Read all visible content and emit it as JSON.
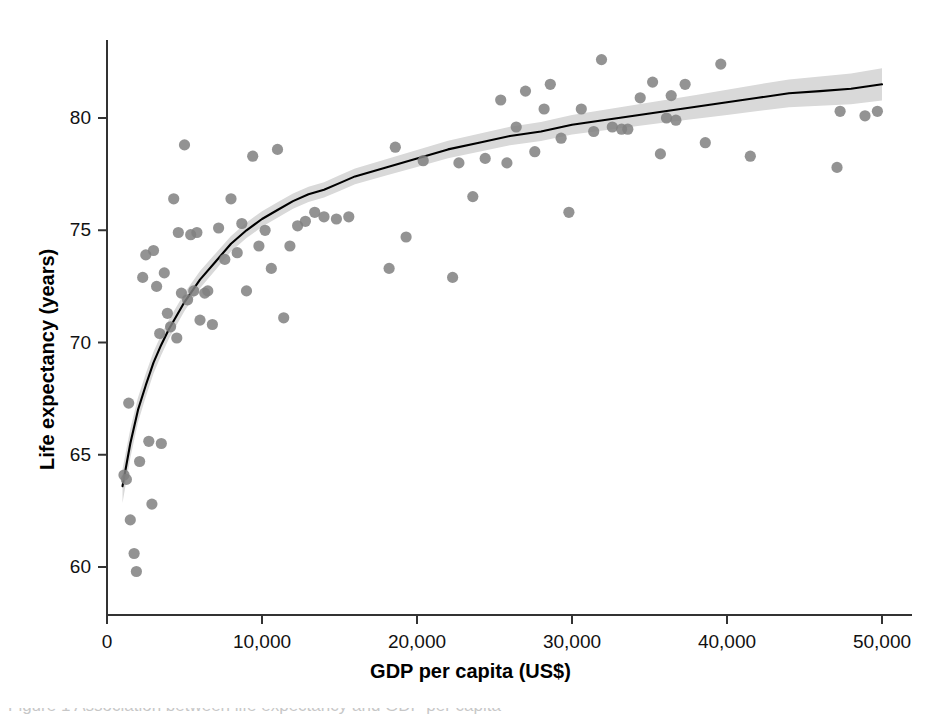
{
  "figure": {
    "background_color": "#ffffff",
    "caption_partial": "Figure 1  Association between life expectancy and GDP per capita"
  },
  "axes": {
    "x": {
      "title": "GDP per capita (US$)",
      "ticks": [
        {
          "label": "0",
          "value": 0
        },
        {
          "label": "10,000",
          "value": 10000
        },
        {
          "label": "20,000",
          "value": 20000
        },
        {
          "label": "30,000",
          "value": 30000
        },
        {
          "label": "40,000",
          "value": 40000
        },
        {
          "label": "50,000",
          "value": 50000
        }
      ],
      "min": 0,
      "max": 52000
    },
    "y": {
      "title": "Life expectancy (years)",
      "ticks": [
        {
          "label": "60",
          "value": 60
        },
        {
          "label": "65",
          "value": 65
        },
        {
          "label": "70",
          "value": 70
        },
        {
          "label": "75",
          "value": 75
        },
        {
          "label": "80",
          "value": 80
        }
      ],
      "min": 58.3,
      "max": 83.8
    }
  },
  "style": {
    "point_color": "#808080",
    "point_radius": 5.6,
    "line_color": "#000000",
    "band_color": "#d9d9d9",
    "axis_color": "#333333"
  },
  "chart_data": {
    "type": "scatter",
    "title": "",
    "xlabel": "GDP per capita (US$)",
    "ylabel": "Life expectancy (years)",
    "xlim": [
      0,
      52000
    ],
    "ylim": [
      58.3,
      83.8
    ],
    "grid": false,
    "legend": null,
    "series": [
      {
        "name": "Countries",
        "type": "scatter",
        "marker": "circle",
        "color": "#808080",
        "points": [
          [
            1100,
            64.1
          ],
          [
            1250,
            63.9
          ],
          [
            1400,
            67.3
          ],
          [
            1500,
            62.1
          ],
          [
            1750,
            60.6
          ],
          [
            1900,
            59.8
          ],
          [
            2100,
            64.7
          ],
          [
            2300,
            72.9
          ],
          [
            2500,
            73.9
          ],
          [
            2700,
            65.6
          ],
          [
            2900,
            62.8
          ],
          [
            3000,
            74.1
          ],
          [
            3200,
            72.5
          ],
          [
            3400,
            70.4
          ],
          [
            3500,
            65.5
          ],
          [
            3700,
            73.1
          ],
          [
            3900,
            71.3
          ],
          [
            4100,
            70.7
          ],
          [
            4300,
            76.4
          ],
          [
            4500,
            70.2
          ],
          [
            4600,
            74.9
          ],
          [
            4800,
            72.2
          ],
          [
            5000,
            78.8
          ],
          [
            5200,
            71.9
          ],
          [
            5400,
            74.8
          ],
          [
            5600,
            72.3
          ],
          [
            5800,
            74.9
          ],
          [
            6000,
            71.0
          ],
          [
            6300,
            72.2
          ],
          [
            6500,
            72.3
          ],
          [
            6800,
            70.8
          ],
          [
            7200,
            75.1
          ],
          [
            7600,
            73.7
          ],
          [
            8000,
            76.4
          ],
          [
            8400,
            74.0
          ],
          [
            8700,
            75.3
          ],
          [
            9000,
            72.3
          ],
          [
            9400,
            78.3
          ],
          [
            9800,
            74.3
          ],
          [
            10200,
            75.0
          ],
          [
            10600,
            73.3
          ],
          [
            11000,
            78.6
          ],
          [
            11400,
            71.1
          ],
          [
            11800,
            74.3
          ],
          [
            12300,
            75.2
          ],
          [
            12800,
            75.4
          ],
          [
            13400,
            75.8
          ],
          [
            14000,
            75.6
          ],
          [
            14800,
            75.5
          ],
          [
            15600,
            75.6
          ],
          [
            18200,
            73.3
          ],
          [
            18600,
            78.7
          ],
          [
            19300,
            74.7
          ],
          [
            20400,
            78.1
          ],
          [
            22300,
            72.9
          ],
          [
            22700,
            78.0
          ],
          [
            23600,
            76.5
          ],
          [
            24400,
            78.2
          ],
          [
            25400,
            80.8
          ],
          [
            25800,
            78.0
          ],
          [
            26400,
            79.6
          ],
          [
            27000,
            81.2
          ],
          [
            27600,
            78.5
          ],
          [
            28200,
            80.4
          ],
          [
            28600,
            81.5
          ],
          [
            29300,
            79.1
          ],
          [
            29800,
            75.8
          ],
          [
            30600,
            80.4
          ],
          [
            31400,
            79.4
          ],
          [
            31900,
            82.6
          ],
          [
            32600,
            79.6
          ],
          [
            33200,
            79.5
          ],
          [
            33600,
            79.5
          ],
          [
            34400,
            80.9
          ],
          [
            35200,
            81.6
          ],
          [
            35700,
            78.4
          ],
          [
            36100,
            80.0
          ],
          [
            36400,
            81.0
          ],
          [
            36700,
            79.9
          ],
          [
            37300,
            81.5
          ],
          [
            38600,
            78.9
          ],
          [
            39600,
            82.4
          ],
          [
            41500,
            78.3
          ],
          [
            47100,
            77.8
          ],
          [
            47300,
            80.3
          ],
          [
            48900,
            80.1
          ],
          [
            49700,
            80.3
          ]
        ]
      },
      {
        "name": "Logarithmic fit",
        "type": "line",
        "color": "#000000",
        "fit": "y = 44.6 + 3.42 * ln(x)",
        "points": [
          [
            1000,
            63.6
          ],
          [
            1500,
            65.5
          ],
          [
            2000,
            67.0
          ],
          [
            2500,
            68.1
          ],
          [
            3000,
            69.1
          ],
          [
            3500,
            69.9
          ],
          [
            4000,
            70.6
          ],
          [
            5000,
            71.8
          ],
          [
            6000,
            72.8
          ],
          [
            7000,
            73.6
          ],
          [
            8000,
            74.4
          ],
          [
            9000,
            75.0
          ],
          [
            10000,
            75.5
          ],
          [
            11000,
            75.9
          ],
          [
            12000,
            76.3
          ],
          [
            13000,
            76.6
          ],
          [
            14000,
            76.8
          ],
          [
            15000,
            77.1
          ],
          [
            16000,
            77.4
          ],
          [
            18000,
            77.8
          ],
          [
            20000,
            78.2
          ],
          [
            22000,
            78.6
          ],
          [
            24000,
            78.9
          ],
          [
            26000,
            79.2
          ],
          [
            28000,
            79.4
          ],
          [
            30000,
            79.7
          ],
          [
            32000,
            79.9
          ],
          [
            34000,
            80.1
          ],
          [
            36000,
            80.3
          ],
          [
            38000,
            80.5
          ],
          [
            40000,
            80.7
          ],
          [
            42000,
            80.9
          ],
          [
            44000,
            81.1
          ],
          [
            46000,
            81.2
          ],
          [
            48000,
            81.3
          ],
          [
            50000,
            81.5
          ]
        ]
      },
      {
        "name": "95% confidence band",
        "type": "band",
        "color": "#d9d9d9",
        "half_width": [
          [
            1000,
            0.75
          ],
          [
            2000,
            0.55
          ],
          [
            4000,
            0.42
          ],
          [
            8000,
            0.35
          ],
          [
            14000,
            0.34
          ],
          [
            20000,
            0.38
          ],
          [
            28000,
            0.42
          ],
          [
            36000,
            0.5
          ],
          [
            44000,
            0.62
          ],
          [
            50000,
            0.72
          ]
        ]
      }
    ]
  }
}
